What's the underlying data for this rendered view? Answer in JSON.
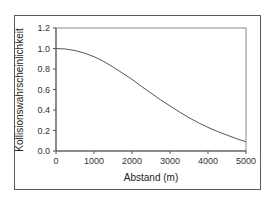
{
  "chart_data": {
    "type": "line",
    "title": "",
    "xlabel": "Abstand (m)",
    "ylabel": "Kollisionswahrscheinlichkeit",
    "xlim": [
      0,
      5000
    ],
    "ylim": [
      0.0,
      1.2
    ],
    "x_ticks": [
      "0",
      "1000",
      "2000",
      "3000",
      "4000",
      "5000"
    ],
    "y_ticks": [
      "0.0",
      "0.2",
      "0.4",
      "0.6",
      "0.8",
      "1.0",
      "1.2"
    ],
    "grid": false,
    "legend": null,
    "series": [
      {
        "name": "Kollisionswahrscheinlichkeit",
        "color": "#555555",
        "x": [
          0,
          250,
          500,
          750,
          1000,
          1250,
          1500,
          1750,
          2000,
          2250,
          2500,
          2750,
          3000,
          3250,
          3500,
          3750,
          4000,
          4250,
          4500,
          4750,
          5000
        ],
        "y": [
          1.0,
          0.995,
          0.98,
          0.955,
          0.92,
          0.875,
          0.82,
          0.76,
          0.7,
          0.63,
          0.565,
          0.5,
          0.44,
          0.38,
          0.325,
          0.275,
          0.23,
          0.19,
          0.155,
          0.12,
          0.09
        ]
      }
    ]
  }
}
